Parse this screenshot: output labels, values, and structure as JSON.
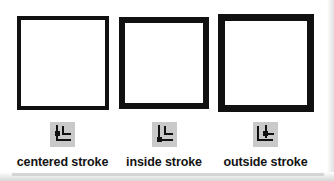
{
  "figure": {
    "items": [
      {
        "id": "centered-stroke",
        "label": "centered stroke",
        "icon": "stroke-align-center-icon",
        "border_width_px": 4,
        "border_color": "#111111",
        "fill_color": "#ffffff"
      },
      {
        "id": "inside-stroke",
        "label": "inside stroke",
        "icon": "stroke-align-inside-icon",
        "border_width_px": 6,
        "border_color": "#111111",
        "fill_color": "#ffffff"
      },
      {
        "id": "outside-stroke",
        "label": "outside stroke",
        "icon": "stroke-align-outside-icon",
        "border_width_px": 7,
        "border_color": "#111111",
        "fill_color": "#ffffff"
      }
    ]
  },
  "colors": {
    "icon_chip_background": "#c9c9c9",
    "icon_foreground": "#111111",
    "page_background": "#ffffff",
    "page_edge_shadow": "#d7d7d7"
  }
}
